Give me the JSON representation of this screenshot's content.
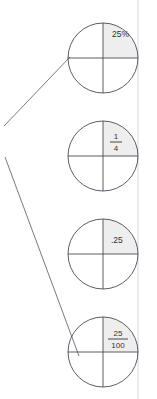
{
  "figure": {
    "kind": "fraction-circle-diagram",
    "background_color": "#ffffff",
    "stroke_color": "#4a4a55",
    "shade_color": "#eeeeee",
    "text_color": "#333333",
    "scan_line_color": "#e2e2e8",
    "circles": [
      {
        "id": "circle-percent",
        "cx": 103,
        "cy": 58,
        "r": 35,
        "shaded_quadrant": "upper-right",
        "label_kind": "plain",
        "label": "25%",
        "label_x": 112,
        "label_y": 37
      },
      {
        "id": "circle-fraction-quarter",
        "cx": 103,
        "cy": 156,
        "r": 35,
        "shaded_quadrant": "upper-right",
        "label_kind": "fraction",
        "numerator": "1",
        "denominator": "4",
        "label_x": 116,
        "label_y": 136
      },
      {
        "id": "circle-decimal",
        "cx": 103,
        "cy": 254,
        "r": 35,
        "shaded_quadrant": "upper-right",
        "label_kind": "plain",
        "label": ".25",
        "label_x": 111,
        "label_y": 234
      },
      {
        "id": "circle-fraction-hundredths",
        "cx": 103,
        "cy": 352,
        "r": 35,
        "shaded_quadrant": "upper-right",
        "label_kind": "fraction",
        "numerator": "25",
        "denominator": "100",
        "label_x": 118,
        "label_y": 332
      }
    ],
    "connector_lines": [
      {
        "id": "connector-upper",
        "x1": 4,
        "y1": 126,
        "x2": 70,
        "y2": 57
      },
      {
        "id": "connector-lower",
        "x1": 5,
        "y1": 157,
        "x2": 79,
        "y2": 356
      }
    ],
    "scan_line": {
      "x": 138,
      "y1": 0,
      "y2": 399
    }
  }
}
